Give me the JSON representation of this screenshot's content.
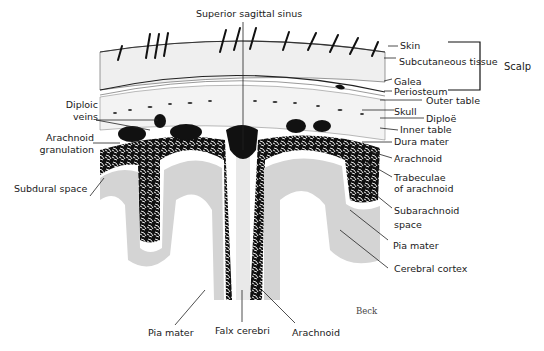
{
  "figure": {
    "credit": "Beck",
    "labels": {
      "top": "Superior sagittal sinus",
      "left": {
        "diploic_veins": [
          "Diploic",
          "veins"
        ],
        "arachnoid_granulation": [
          "Arachnoid",
          "granulation"
        ],
        "subdural_space": "Subdural space"
      },
      "right": {
        "skin": "Skin",
        "subcutaneous_tissue": "Subcutaneous tissue",
        "galea": "Galea",
        "periosteum": "Periosteum",
        "scalp": "Scalp",
        "outer_table": "Outer table",
        "skull": "Skull",
        "diploe": "Diploë",
        "inner_table": "Inner table",
        "dura_mater": "Dura mater",
        "arachnoid": "Arachnoid",
        "trabeculae": [
          "Trabeculae",
          "of arachnoid"
        ],
        "subarachnoid_space": [
          "Subarachnoid",
          "space"
        ],
        "pia_mater": "Pia mater",
        "cerebral_cortex": "Cerebral cortex"
      },
      "bottom": {
        "pia_mater": "Pia mater",
        "falx_cerebri": "Falx cerebri",
        "arachnoid": "Arachnoid"
      }
    },
    "colors": {
      "ink": "#111111",
      "cortex_gray": "#cfcfcf",
      "scalp_light": "#eeeeee",
      "bone": "#f3f3f3",
      "white_matter": "#ffffff"
    }
  }
}
